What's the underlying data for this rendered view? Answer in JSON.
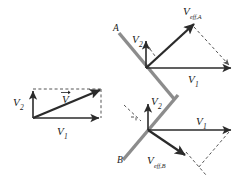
{
  "figure": {
    "background_color": "#ffffff",
    "colors": {
      "vector_dark": "#2b2b2b",
      "dashed_gray": "#555555",
      "surface_gray": "#8c8c8c",
      "label_text": "#1a1a1a"
    },
    "panels": [
      {
        "id": "panel-left",
        "name": "resultant-velocity-panel",
        "description": "Rectangle construction showing V1 horizontal, V2 vertical and resultant V",
        "labels": [
          {
            "name": "v2-label",
            "text": "V",
            "sub": "2"
          },
          {
            "name": "v1-label",
            "text": "V",
            "sub": "1"
          },
          {
            "name": "v-resultant-label",
            "text": "V",
            "sub": ""
          }
        ]
      },
      {
        "id": "panel-top-right",
        "name": "surface-a-panel",
        "description": "Surface A inclined, V1 horizontal, V2 vertical, effective velocity V_eff,A up-right",
        "labels": [
          {
            "name": "surface-a-label",
            "text": "A",
            "sub": ""
          },
          {
            "name": "v2-label",
            "text": "V",
            "sub": "2"
          },
          {
            "name": "v1-label",
            "text": "V",
            "sub": "1"
          },
          {
            "name": "veff-a-label",
            "text": "V",
            "sub": "eff,A"
          }
        ]
      },
      {
        "id": "panel-bottom-right",
        "name": "surface-b-panel",
        "description": "Surface B inclined, V1 horizontal, V2 vertical, effective velocity V_eff,B down-right",
        "labels": [
          {
            "name": "surface-b-label",
            "text": "B",
            "sub": ""
          },
          {
            "name": "v2-label",
            "text": "V",
            "sub": "2"
          },
          {
            "name": "v1-label",
            "text": "V",
            "sub": "1"
          },
          {
            "name": "veff-b-label",
            "text": "V",
            "sub": "eff,B"
          }
        ]
      }
    ],
    "text": {
      "V": "V",
      "sub_1": "1",
      "sub_2": "2",
      "sub_eff_A": "eff,A",
      "sub_eff_B": "eff,B",
      "label_A": "A",
      "label_B": "B"
    }
  }
}
